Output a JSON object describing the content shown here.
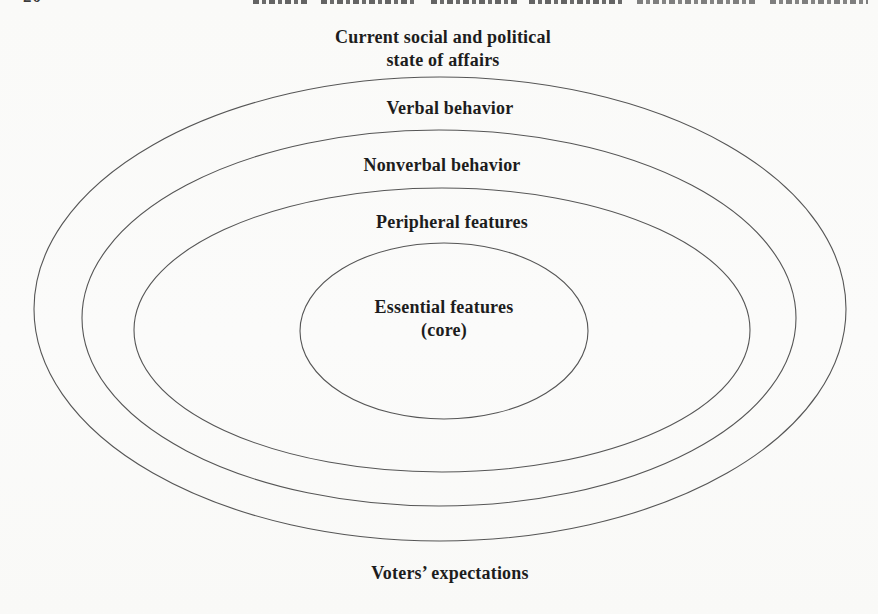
{
  "page": {
    "background": "#fbfbf9",
    "header": {
      "page_number": "20"
    }
  },
  "diagram": {
    "type": "concentric-ellipses",
    "line_color": "#565656",
    "text_color": "#1d1d1d",
    "top_caption": {
      "line1": "Current social and political",
      "line2": "state of affairs"
    },
    "ring_labels": [
      "Verbal behavior",
      "Nonverbal behavior",
      "Peripheral features"
    ],
    "core_label": {
      "line1": "Essential features",
      "line2": "(core)"
    },
    "bottom_caption": "Voters’ expectations",
    "ellipses": [
      {
        "cx": 440,
        "cy": 309,
        "rx": 406,
        "ry": 232
      },
      {
        "cx": 439,
        "cy": 318,
        "rx": 357,
        "ry": 188
      },
      {
        "cx": 442,
        "cy": 330,
        "rx": 308,
        "ry": 142
      },
      {
        "cx": 444,
        "cy": 331,
        "rx": 144,
        "ry": 88
      }
    ]
  }
}
